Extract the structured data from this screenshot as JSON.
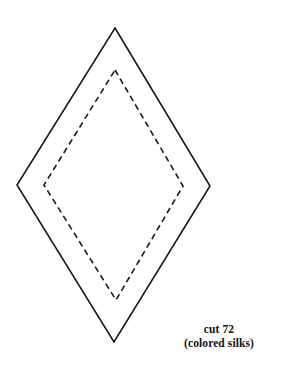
{
  "document": {
    "kind": "sewing-pattern-piece",
    "title": "Diamond pattern piece",
    "background_color": "#ffffff"
  },
  "diagram": {
    "cutting_line": {
      "name": "outer cutting line",
      "style": "solid",
      "color": "#1a1a1a",
      "stroke_width": 1.6,
      "points": [
        {
          "x": 115,
          "y": 28
        },
        {
          "x": 210,
          "y": 186
        },
        {
          "x": 114,
          "y": 342
        },
        {
          "x": 17,
          "y": 185
        }
      ]
    },
    "stitching_line": {
      "name": "inner stitching line (seam allowance)",
      "style": "dashed",
      "color": "#1a1a1a",
      "stroke_width": 1.6,
      "dash_pattern": "6,4",
      "points": [
        {
          "x": 115,
          "y": 70
        },
        {
          "x": 183,
          "y": 186
        },
        {
          "x": 116,
          "y": 300
        },
        {
          "x": 44,
          "y": 185
        }
      ]
    }
  },
  "caption": {
    "line1": "cut 72",
    "line2": "(colored silks)",
    "quantity": 72,
    "material": "colored silks"
  }
}
